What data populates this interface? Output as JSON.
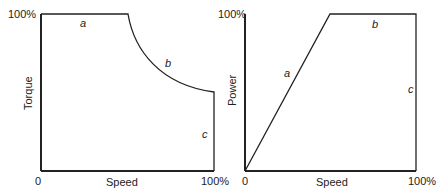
{
  "left_chart": {
    "ylabel": "Torque",
    "xlabel": "Speed",
    "y_max_label": "100%",
    "x_min_label": "0",
    "x_max_label": "100%",
    "region_labels": {
      "a": "a",
      "b": "b",
      "c": "c"
    }
  },
  "right_chart": {
    "ylabel": "Power",
    "xlabel": "Speed",
    "y_max_label": "100%",
    "x_min_label": "0",
    "x_max_label": "100%",
    "region_labels": {
      "a": "a",
      "b": "b",
      "c": "c"
    }
  },
  "colors": {
    "line": "#222222",
    "background": "#ffffff"
  }
}
